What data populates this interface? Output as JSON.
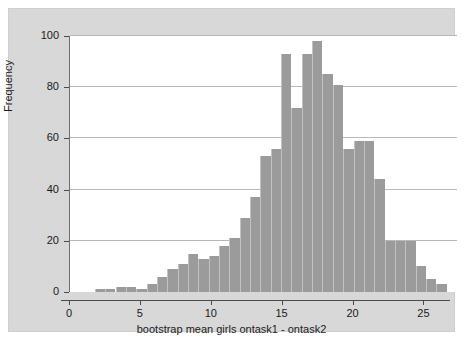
{
  "chart_data": {
    "type": "bar",
    "title": "",
    "subtitle": "",
    "xlabel": "bootstrap mean girls ontask1 - ontask2",
    "ylabel": "Frequency",
    "xlim": [
      0,
      27.3
    ],
    "ylim": [
      0,
      100
    ],
    "grid": "horizontal",
    "legend": "none",
    "bar_color": "#9b9b9b",
    "plot_background": "#ffffff",
    "graph_background": "#d8d8d8",
    "bin_width": 0.73,
    "xticks": [
      {
        "value": 0,
        "label": "0"
      },
      {
        "value": 5,
        "label": "5"
      },
      {
        "value": 10,
        "label": "10"
      },
      {
        "value": 15,
        "label": "15"
      },
      {
        "value": 20,
        "label": "20"
      },
      {
        "value": 25,
        "label": "25"
      }
    ],
    "yticks": [
      {
        "value": 0,
        "label": "0"
      },
      {
        "value": 20,
        "label": "20"
      },
      {
        "value": 40,
        "label": "40"
      },
      {
        "value": 60,
        "label": "60"
      },
      {
        "value": 80,
        "label": "80"
      },
      {
        "value": 100,
        "label": "100"
      }
    ],
    "bins": [
      {
        "x0": 1.75,
        "x1": 2.48,
        "value": 1
      },
      {
        "x0": 2.48,
        "x1": 3.21,
        "value": 1
      },
      {
        "x0": 3.21,
        "x1": 3.94,
        "value": 2
      },
      {
        "x0": 3.94,
        "x1": 4.67,
        "value": 2
      },
      {
        "x0": 4.67,
        "x1": 5.4,
        "value": 1
      },
      {
        "x0": 5.4,
        "x1": 6.13,
        "value": 3
      },
      {
        "x0": 6.13,
        "x1": 6.86,
        "value": 6
      },
      {
        "x0": 6.86,
        "x1": 7.59,
        "value": 9
      },
      {
        "x0": 7.59,
        "x1": 8.32,
        "value": 11
      },
      {
        "x0": 8.32,
        "x1": 9.05,
        "value": 15
      },
      {
        "x0": 9.05,
        "x1": 9.78,
        "value": 13
      },
      {
        "x0": 9.78,
        "x1": 10.51,
        "value": 14
      },
      {
        "x0": 10.51,
        "x1": 11.24,
        "value": 18
      },
      {
        "x0": 11.24,
        "x1": 11.97,
        "value": 21
      },
      {
        "x0": 11.97,
        "x1": 12.7,
        "value": 29
      },
      {
        "x0": 12.7,
        "x1": 13.43,
        "value": 37
      },
      {
        "x0": 13.43,
        "x1": 14.16,
        "value": 53
      },
      {
        "x0": 14.16,
        "x1": 14.89,
        "value": 56
      },
      {
        "x0": 14.89,
        "x1": 15.62,
        "value": 93
      },
      {
        "x0": 15.62,
        "x1": 16.35,
        "value": 72
      },
      {
        "x0": 16.35,
        "x1": 17.08,
        "value": 93
      },
      {
        "x0": 17.08,
        "x1": 17.81,
        "value": 98
      },
      {
        "x0": 17.81,
        "x1": 18.54,
        "value": 85
      },
      {
        "x0": 18.54,
        "x1": 19.27,
        "value": 81
      },
      {
        "x0": 19.27,
        "x1": 20.0,
        "value": 56
      },
      {
        "x0": 20.0,
        "x1": 20.73,
        "value": 59
      },
      {
        "x0": 20.73,
        "x1": 21.46,
        "value": 59
      },
      {
        "x0": 21.46,
        "x1": 22.19,
        "value": 44
      },
      {
        "x0": 22.19,
        "x1": 22.92,
        "value": 20
      },
      {
        "x0": 22.92,
        "x1": 23.65,
        "value": 20
      },
      {
        "x0": 23.65,
        "x1": 24.38,
        "value": 20
      },
      {
        "x0": 24.38,
        "x1": 25.11,
        "value": 10
      },
      {
        "x0": 25.11,
        "x1": 25.84,
        "value": 5
      },
      {
        "x0": 25.84,
        "x1": 26.57,
        "value": 3
      }
    ]
  }
}
